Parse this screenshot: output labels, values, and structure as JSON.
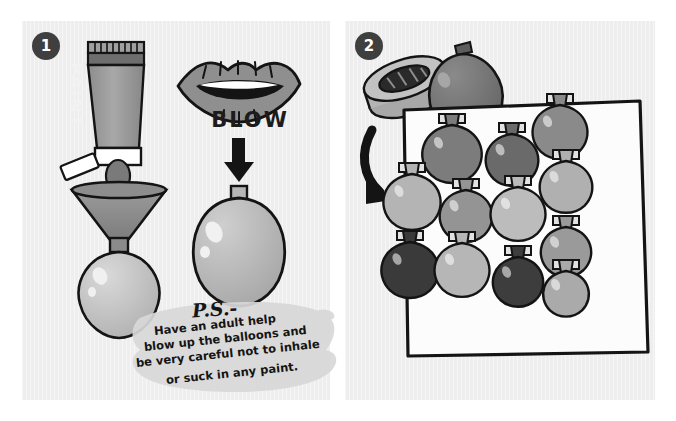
{
  "illustration": {
    "title": "Balloon paint craft instructions",
    "background_color": "#ffffff",
    "panel_background": "#eeeeee",
    "ink_color": "#141414"
  },
  "panels": [
    {
      "id": "panel-1",
      "step_number": "1",
      "caption_word": "BLOW",
      "objects": [
        {
          "name": "paint-tube",
          "label": "PAINT"
        },
        {
          "name": "funnel"
        },
        {
          "name": "balloon-on-funnel"
        },
        {
          "name": "lips"
        },
        {
          "name": "down-arrow"
        },
        {
          "name": "inflated-balloon"
        }
      ]
    },
    {
      "id": "panel-2",
      "step_number": "2",
      "objects": [
        {
          "name": "tape-roll"
        },
        {
          "name": "loose-balloon"
        },
        {
          "name": "curved-arrow"
        },
        {
          "name": "balloon-board"
        }
      ]
    }
  ],
  "ps_note": {
    "heading": "P.S.-",
    "line1": "Have an adult help",
    "line2": "blow up the balloons and",
    "line3": "be very careful not to inhale",
    "line4": "or suck in any paint."
  },
  "tube": {
    "label": "PAINT",
    "body_color": "#9b9b9b",
    "band_color": "#6e6e6e",
    "cap_color": "#ffffff"
  },
  "board": {
    "paper_color": "#fcfcfc",
    "border_color": "#141414",
    "balloon_count": 12,
    "balloons": [
      {
        "row": 1,
        "col": 1,
        "color": "#7c7c7c",
        "x": 452,
        "y": 152,
        "w": 52,
        "h": 58
      },
      {
        "row": 1,
        "col": 2,
        "col_label": "b",
        "color": "#6a6a6a",
        "x": 512,
        "y": 158,
        "w": 46,
        "h": 52
      },
      {
        "row": 1,
        "col": 3,
        "color": "#8a8a8a",
        "x": 560,
        "y": 130,
        "w": 48,
        "h": 54
      },
      {
        "row": 2,
        "col": 1,
        "color": "#b4b4b4",
        "x": 412,
        "y": 200,
        "w": 50,
        "h": 56
      },
      {
        "row": 2,
        "col": 2,
        "color": "#949494",
        "x": 466,
        "y": 214,
        "w": 46,
        "h": 52
      },
      {
        "row": 2,
        "col": 3,
        "color": "#bcbcbc",
        "x": 518,
        "y": 212,
        "w": 48,
        "h": 54
      },
      {
        "row": 2,
        "col": 4,
        "color": "#b0b0b0",
        "x": 566,
        "y": 185,
        "w": 46,
        "h": 52
      },
      {
        "row": 3,
        "col": 1,
        "color": "#3a3a3a",
        "x": 410,
        "y": 268,
        "w": 50,
        "h": 56
      },
      {
        "row": 3,
        "col": 2,
        "color": "#b6b6b6",
        "x": 462,
        "y": 268,
        "w": 48,
        "h": 54
      },
      {
        "row": 3,
        "col": 3,
        "color": "#3d3d3d",
        "x": 518,
        "y": 280,
        "w": 44,
        "h": 50
      },
      {
        "row": 3,
        "col": 4,
        "color": "#9a9a9a",
        "x": 566,
        "y": 250,
        "w": 44,
        "h": 50
      },
      {
        "row": 3,
        "col": 5,
        "color": "#aaaaaa",
        "x": 566,
        "y": 292,
        "w": 40,
        "h": 46
      }
    ]
  },
  "palette": {
    "dark_ink": "#141414",
    "badge_fill": "#3f3f3f",
    "balloon_light": "#cfcfcf",
    "balloon_mid": "#9b9b9b",
    "balloon_dark": "#3a3a3a",
    "funnel_fill": "#8f8f8f",
    "note_brush": "#d8d8d8"
  }
}
